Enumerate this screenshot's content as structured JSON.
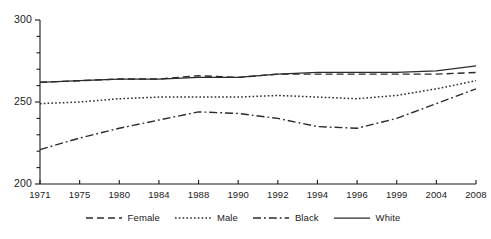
{
  "chart_data": {
    "type": "line",
    "title": "",
    "subtitle": "",
    "xlabel": "",
    "ylabel": "",
    "x": [
      "1971",
      "1975",
      "1980",
      "1984",
      "1988",
      "1990",
      "1992",
      "1994",
      "1996",
      "1999",
      "2004",
      "2008"
    ],
    "xlim_categorical": true,
    "ylim": [
      200,
      300
    ],
    "yticks_major": [
      200,
      250,
      300
    ],
    "yticks_minor_step": 10,
    "grid": false,
    "legend_position": "bottom",
    "series": [
      {
        "name": "Female",
        "style": "dashed",
        "color": "#2b2b2b",
        "values": [
          262,
          263,
          264,
          264,
          266,
          265,
          267,
          267,
          267,
          267,
          267,
          268
        ]
      },
      {
        "name": "Male",
        "style": "dotted",
        "color": "#2b2b2b",
        "values": [
          249,
          250,
          252,
          253,
          253,
          253,
          254,
          253,
          252,
          254,
          258,
          263
        ]
      },
      {
        "name": "Black",
        "style": "dash-dot",
        "color": "#2b2b2b",
        "values": [
          221,
          228,
          234,
          239,
          244,
          243,
          240,
          235,
          234,
          240,
          249,
          258
        ]
      },
      {
        "name": "White",
        "style": "solid",
        "color": "#2b2b2b",
        "values": [
          262,
          263,
          264,
          264,
          265,
          265,
          267,
          268,
          268,
          268,
          269,
          272
        ]
      }
    ]
  },
  "axes": {
    "y_tick_labels": [
      "300",
      "250",
      "200"
    ],
    "x_tick_labels": [
      "1971",
      "1975",
      "1980",
      "1984",
      "1988",
      "1990",
      "1992",
      "1994",
      "1996",
      "1999",
      "2004",
      "2008"
    ]
  },
  "legend": {
    "items": [
      {
        "label": "Female",
        "style": "dashed"
      },
      {
        "label": "Male",
        "style": "dotted"
      },
      {
        "label": "Black",
        "style": "dash-dot"
      },
      {
        "label": "White",
        "style": "solid"
      }
    ]
  }
}
